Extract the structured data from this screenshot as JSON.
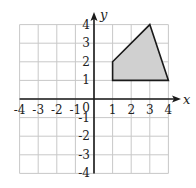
{
  "chart_data": {
    "type": "scatter",
    "title": "",
    "xlabel": "x",
    "ylabel": "y",
    "xlim": [
      -4,
      4
    ],
    "ylim": [
      -4,
      4
    ],
    "grid": true,
    "x_ticks": [
      "-4",
      "-3",
      "-2",
      "-1",
      "1",
      "2",
      "3",
      "4"
    ],
    "y_ticks": [
      "4",
      "3",
      "2",
      "1",
      "-1",
      "-2",
      "-3",
      "-4"
    ],
    "origin_label": "0",
    "shapes": [
      {
        "name": "shaded-quadrilateral",
        "vertices": [
          [
            1,
            1
          ],
          [
            1,
            2
          ],
          [
            3,
            4
          ],
          [
            4,
            1
          ]
        ],
        "fill": "#d0d0d0",
        "stroke": "#1a1a1a"
      }
    ]
  },
  "colors": {
    "grid": "#c8c8c8",
    "axis": "#1a1a1a",
    "shape_fill": "#d0d0d0"
  }
}
